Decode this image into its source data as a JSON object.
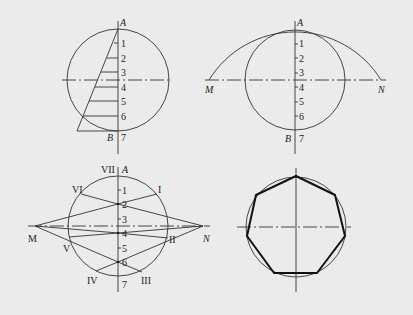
{
  "figures": [
    {
      "id": "fig-a",
      "description": "Circle with triangle construction dividing diameter into 7 equal parts",
      "labels": {
        "A": "A",
        "B": "B"
      },
      "divisions": [
        "1",
        "2",
        "3",
        "4",
        "5",
        "6",
        "7"
      ]
    },
    {
      "id": "fig-b",
      "description": "Arc through A centered at B intersecting horizontal axis at M and N",
      "labels": {
        "A": "A",
        "B": "B",
        "M": "M",
        "N": "N"
      },
      "divisions": [
        "1",
        "2",
        "3",
        "4",
        "5",
        "6",
        "7"
      ]
    },
    {
      "id": "fig-c",
      "description": "Lines from M and N through even division points to circle, giving heptagon vertices",
      "labels": {
        "A": "A",
        "M": "M",
        "N": "N"
      },
      "divisions": [
        "1",
        "2",
        "3",
        "4",
        "5",
        "6",
        "7"
      ],
      "vertices": [
        "I",
        "II",
        "III",
        "IV",
        "V",
        "VI",
        "VII"
      ]
    },
    {
      "id": "fig-d",
      "description": "Resulting regular heptagon inscribed in circle"
    }
  ],
  "colors": {
    "background": "#ebebeb",
    "line": "#333333",
    "thick_line": "#111111"
  }
}
